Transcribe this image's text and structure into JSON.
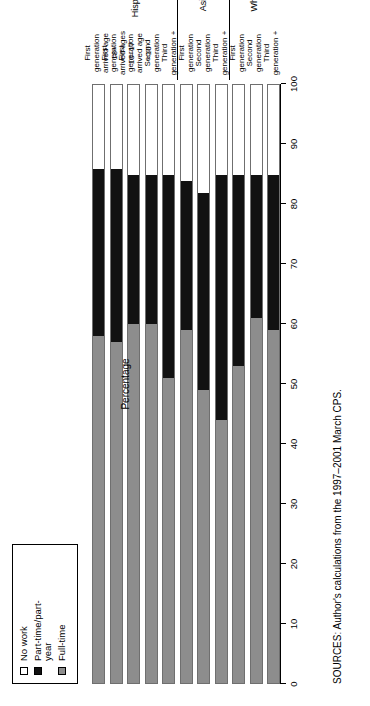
{
  "legend": {
    "items": [
      {
        "key": "no_work",
        "label": "No work",
        "color": "#ffffff"
      },
      {
        "key": "part",
        "label": "Part-time/part-\nyear",
        "color": "#111111"
      },
      {
        "key": "full",
        "label": "Full-time",
        "color": "#8d8d8d"
      }
    ]
  },
  "axis": {
    "title": "Percentage",
    "ticks": [
      "0",
      "10",
      "20",
      "30",
      "40",
      "50",
      "60",
      "70",
      "80",
      "90",
      "100"
    ]
  },
  "groups": [
    {
      "name": "Hispanic"
    },
    {
      "name": "Asian"
    },
    {
      "name": "White"
    }
  ],
  "sources": "SOURCES: Author's calculations from the 1997–2001 March CPS.",
  "chart_data": {
    "type": "bar",
    "title": "",
    "subtitle": "",
    "orientation": "horizontal-stacked",
    "stacked": true,
    "xlabel": "",
    "ylabel": "Percentage",
    "ylim": [
      0,
      100
    ],
    "grid": false,
    "legend_position": "top-left",
    "categories": [
      "First generation arrived age 18+",
      "First generation arrived ages 10–17",
      "First generation arrived age <10",
      "Second generation",
      "Third generation +",
      "First generation",
      "Second generation",
      "Third generation +",
      "First generation",
      "Second generation",
      "Third generation +"
    ],
    "category_groups": [
      "Hispanic",
      "Hispanic",
      "Hispanic",
      "Hispanic",
      "Hispanic",
      "Asian",
      "Asian",
      "Asian",
      "White",
      "White",
      "White"
    ],
    "series": [
      {
        "name": "Full-time",
        "color": "#8d8d8d",
        "values": [
          58,
          57,
          60,
          60,
          51,
          59,
          49,
          44,
          53,
          61,
          59
        ]
      },
      {
        "name": "Part-time/part-year",
        "color": "#111111",
        "values": [
          28,
          29,
          25,
          25,
          34,
          25,
          33,
          41,
          32,
          24,
          26
        ]
      },
      {
        "name": "No work",
        "color": "#ffffff",
        "values": [
          14,
          14,
          15,
          15,
          15,
          16,
          18,
          15,
          15,
          15,
          15
        ]
      }
    ],
    "annotations": [
      "SOURCES: Author's calculations from the 1997–2001 March CPS."
    ]
  }
}
